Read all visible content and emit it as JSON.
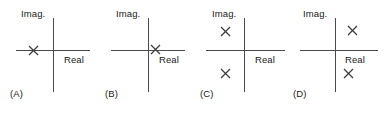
{
  "figure": {
    "background_color": "#ffffff",
    "axis_color": "#4a4a4a",
    "text_color": "#1a1a1a",
    "pole_marker": "x-marker"
  },
  "axis_labels": {
    "imaginary": "Imag.",
    "real": "Real"
  },
  "panels": [
    {
      "id": "A",
      "tag": "(A)",
      "imag_label": "Imag.",
      "real_label": "Real",
      "poles": [
        {
          "name": "pole-1",
          "real": -0.55,
          "imag": 0.0
        }
      ]
    },
    {
      "id": "B",
      "tag": "(B)",
      "imag_label": "Imag.",
      "real_label": "Real",
      "poles": [
        {
          "name": "pole-1",
          "real": 0.28,
          "imag": 0.0
        }
      ]
    },
    {
      "id": "C",
      "tag": "(C)",
      "imag_label": "Imag.",
      "real_label": "Real",
      "poles": [
        {
          "name": "pole-1",
          "real": -0.48,
          "imag": 0.62
        },
        {
          "name": "pole-2",
          "real": -0.48,
          "imag": -0.62
        }
      ]
    },
    {
      "id": "D",
      "tag": "(D)",
      "imag_label": "Imag.",
      "real_label": "Real",
      "poles": [
        {
          "name": "pole-1",
          "real": 0.45,
          "imag": 0.62
        },
        {
          "name": "pole-2",
          "real": 0.38,
          "imag": -0.62
        }
      ]
    }
  ]
}
